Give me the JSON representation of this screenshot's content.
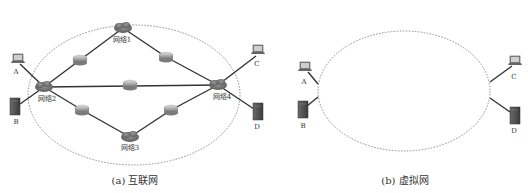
{
  "figure_a": {
    "caption": "(a) 互联网",
    "networks": [
      {
        "id": "net1",
        "label": "网络1",
        "x": 123,
        "y": 28,
        "lx": 122,
        "ly": 42
      },
      {
        "id": "net2",
        "label": "网络2",
        "x": 44,
        "y": 87,
        "lx": 47,
        "ly": 101
      },
      {
        "id": "net3",
        "label": "网络3",
        "x": 130,
        "y": 137,
        "lx": 130,
        "ly": 150
      },
      {
        "id": "net4",
        "label": "网络4",
        "x": 218,
        "y": 85,
        "lx": 222,
        "ly": 99
      }
    ],
    "routers": [
      {
        "id": "r1",
        "x": 80,
        "y": 60
      },
      {
        "id": "r2",
        "x": 166,
        "y": 57
      },
      {
        "id": "r3",
        "x": 130,
        "y": 85
      },
      {
        "id": "r4",
        "x": 82,
        "y": 110
      },
      {
        "id": "r5",
        "x": 171,
        "y": 110
      }
    ],
    "hosts": [
      {
        "id": "A",
        "label": "A",
        "type": "laptop",
        "x": 18,
        "y": 60,
        "lx": 16,
        "ly": 74
      },
      {
        "id": "B",
        "label": "B",
        "type": "server",
        "x": 15,
        "y": 107,
        "lx": 16,
        "ly": 124
      },
      {
        "id": "C",
        "label": "C",
        "type": "laptop",
        "x": 258,
        "y": 51,
        "lx": 257,
        "ly": 66
      },
      {
        "id": "D",
        "label": "D",
        "type": "server",
        "x": 258,
        "y": 112,
        "lx": 257,
        "ly": 129
      }
    ],
    "ellipse": {
      "cx": 134,
      "cy": 95,
      "rx": 106,
      "ry": 70
    }
  },
  "figure_b": {
    "caption": "(b) 虚拟网",
    "hosts": [
      {
        "id": "A",
        "label": "A",
        "type": "laptop",
        "x": 305,
        "y": 68,
        "lx": 304,
        "ly": 84
      },
      {
        "id": "B",
        "label": "B",
        "type": "server",
        "x": 303,
        "y": 110,
        "lx": 303,
        "ly": 128
      },
      {
        "id": "C",
        "label": "C",
        "type": "laptop",
        "x": 515,
        "y": 62,
        "lx": 514,
        "ly": 79
      },
      {
        "id": "D",
        "label": "D",
        "type": "server",
        "x": 515,
        "y": 116,
        "lx": 514,
        "ly": 133
      }
    ],
    "ellipse": {
      "cx": 404,
      "cy": 91,
      "rx": 86,
      "ry": 60
    }
  },
  "colors": {
    "link": "#333333",
    "cloud": "#7a7a7a",
    "router": "#b8b8b8",
    "server": "#555555",
    "boundary": "#777777"
  }
}
